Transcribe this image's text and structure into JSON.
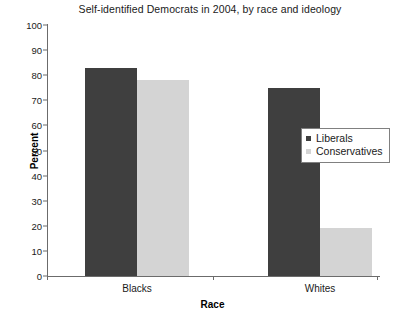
{
  "chart_data": {
    "type": "bar",
    "title": "Self-identified Democrats in 2004, by race and ideology",
    "xlabel": "Race",
    "ylabel": "Percent",
    "categories": [
      "Blacks",
      "Whites"
    ],
    "series": [
      {
        "name": "Liberals",
        "color": "#3f3f3f",
        "values": [
          83,
          75
        ]
      },
      {
        "name": "Conservatives",
        "color": "#d4d4d4",
        "values": [
          78,
          19
        ]
      }
    ],
    "ylim": [
      0,
      100
    ],
    "ytick_step": 10,
    "yticks": [
      0,
      10,
      20,
      30,
      40,
      50,
      60,
      70,
      80,
      90,
      100
    ],
    "ytick_labels": [
      "0",
      "10",
      "20",
      "30",
      "40",
      "50",
      "60",
      "70",
      "80",
      "90",
      "100"
    ],
    "grid": false,
    "legend_position": "right-middle",
    "axis_color": "#6b6b6b",
    "background": "#ffffff"
  },
  "legend": {
    "items": [
      {
        "label": "Liberals",
        "color": "#3f3f3f"
      },
      {
        "label": "Conservatives",
        "color": "#d4d4d4"
      }
    ]
  }
}
